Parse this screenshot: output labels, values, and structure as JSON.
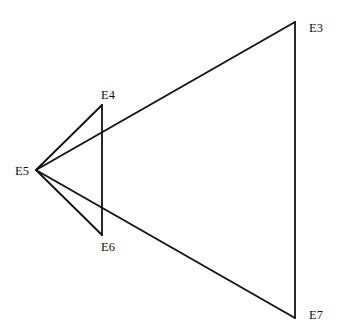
{
  "diagram": {
    "type": "geometric-graph",
    "line_color": "#111111",
    "nodes": [
      {
        "id": "E3",
        "label": "E3",
        "x": 295,
        "y": 22,
        "lx": 309,
        "ly": 32
      },
      {
        "id": "E4",
        "label": "E4",
        "x": 102,
        "y": 105,
        "lx": 101,
        "ly": 99
      },
      {
        "id": "E5",
        "label": "E5",
        "x": 36,
        "y": 170,
        "lx": 15,
        "ly": 175
      },
      {
        "id": "E6",
        "label": "E6",
        "x": 102,
        "y": 235,
        "lx": 101,
        "ly": 251
      },
      {
        "id": "E7",
        "label": "E7",
        "x": 295,
        "y": 318,
        "lx": 309,
        "ly": 319
      }
    ],
    "edges": [
      [
        "E5",
        "E4"
      ],
      [
        "E4",
        "E6"
      ],
      [
        "E6",
        "E5"
      ],
      [
        "E5",
        "E3"
      ],
      [
        "E3",
        "E7"
      ],
      [
        "E7",
        "E5"
      ]
    ]
  }
}
